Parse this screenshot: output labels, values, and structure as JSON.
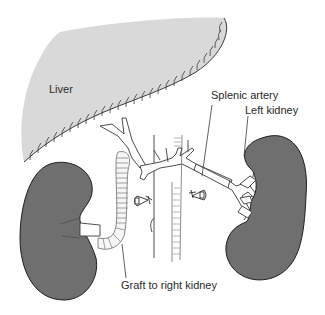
{
  "diagram": {
    "type": "anatomical-illustration",
    "labels": {
      "liver": "Liver",
      "splenic_artery": "Splenic artery",
      "left_kidney": "Left kidney",
      "graft": "Graft to right kidney"
    },
    "colors": {
      "liver_fill": "#d9d9d9",
      "kidney_fill": "#6f6f6f",
      "outline": "#2a2a2a",
      "vessel_fill": "#ffffff",
      "background": "#ffffff"
    },
    "structures": [
      "liver",
      "hepatic-artery-branches",
      "celiac-trunk",
      "aorta",
      "inferior-vena-cava",
      "splenic-artery",
      "left-kidney",
      "left-renal-vessels",
      "right-kidney",
      "ligated-renal-stumps",
      "graft-to-right-kidney"
    ]
  }
}
